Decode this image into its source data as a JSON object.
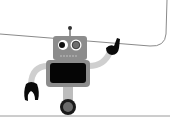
{
  "illustration": {
    "subject": "robot-holding-box",
    "colors": {
      "background": "#ffffff",
      "outline": "#8a8a8a",
      "robot_body": "#8c8c8c",
      "robot_limbs": "#cfcfcf",
      "screen": "#050505",
      "claw": "#0a0a0a",
      "eye_white": "#ffffff",
      "pupil_left": "#111111",
      "pupil_right": "#6e6e6e",
      "wheel_outer": "#1a1a1a",
      "wheel_inner": "#6a6a6a",
      "ground": "#9a9a9a"
    }
  }
}
